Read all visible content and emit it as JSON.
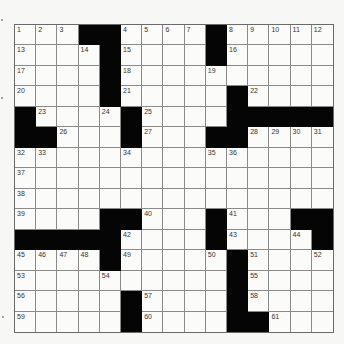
{
  "puzzle": {
    "rows": 15,
    "cols": 15,
    "colors": {
      "black": "#050505",
      "white": "#fbfbfa",
      "grid_line": "#8a8a8a"
    },
    "grid": [
      [
        "1",
        "2",
        "3",
        "#",
        "#",
        "4",
        "5",
        "6",
        "7",
        "#",
        "8",
        "9",
        "10",
        "11",
        "12"
      ],
      [
        "13",
        "",
        "",
        "14",
        "#",
        "15",
        "",
        "",
        "",
        "#",
        "16",
        "",
        "",
        "",
        ""
      ],
      [
        "17",
        "",
        "",
        "",
        "#",
        "18",
        "",
        "",
        "",
        "19",
        "",
        "",
        "",
        "",
        ""
      ],
      [
        "20",
        "",
        "",
        "",
        "#",
        "21",
        "",
        "",
        "",
        "",
        "#",
        "22",
        "",
        "",
        ""
      ],
      [
        "#",
        "23",
        "",
        "",
        "24",
        "#",
        "25",
        "",
        "",
        "",
        "#",
        "#",
        "#",
        "#",
        "#"
      ],
      [
        "#",
        "#",
        "26",
        "",
        "",
        "#",
        "27",
        "",
        "",
        "#",
        "#",
        "28",
        "29",
        "30",
        "31"
      ],
      [
        "32",
        "33",
        "",
        "",
        "",
        "34",
        "",
        "",
        "",
        "35",
        "36",
        "",
        "",
        "",
        ""
      ],
      [
        "37",
        "",
        "",
        "",
        "",
        "",
        "",
        "",
        "",
        "",
        "",
        "",
        "",
        "",
        ""
      ],
      [
        "38",
        "",
        "",
        "",
        "",
        "",
        "",
        "",
        "",
        "",
        "",
        "",
        "",
        "",
        ""
      ],
      [
        "39",
        "",
        "",
        "",
        "#",
        "#",
        "40",
        "",
        "",
        "#",
        "41",
        "",
        "",
        "#",
        "#"
      ],
      [
        "#",
        "#",
        "#",
        "#",
        "#",
        "42",
        "",
        "",
        "",
        "#",
        "43",
        "",
        "",
        "44",
        "#"
      ],
      [
        "45",
        "46",
        "47",
        "48",
        "#",
        "49",
        "",
        "",
        "",
        "50",
        "#",
        "51",
        "",
        "",
        "52"
      ],
      [
        "53",
        "",
        "",
        "",
        "54",
        "",
        "",
        "",
        "",
        "",
        "#",
        "55",
        "",
        "",
        ""
      ],
      [
        "56",
        "",
        "",
        "",
        "",
        "#",
        "57",
        "",
        "",
        "",
        "#",
        "58",
        "",
        "",
        ""
      ],
      [
        "59",
        "",
        "",
        "",
        "",
        "#",
        "60",
        "",
        "",
        "",
        "#",
        "#",
        "61",
        "",
        ""
      ]
    ]
  }
}
